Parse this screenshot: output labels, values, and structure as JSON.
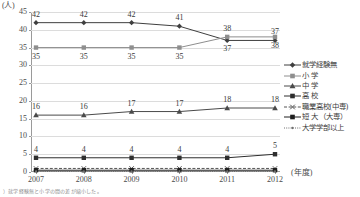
{
  "chart_data": {
    "type": "line",
    "title": "",
    "xlabel": "(年度)",
    "ylabel": "(人)",
    "categories": [
      "2007",
      "2008",
      "2009",
      "2010",
      "2011",
      "2012"
    ],
    "ylim": [
      0,
      45
    ],
    "ytick_step": 5,
    "yticks": [
      "0",
      "5",
      "10",
      "15",
      "20",
      "25",
      "30",
      "35",
      "40",
      "45"
    ],
    "grid": true,
    "legend_position": "right",
    "series": [
      {
        "name": "就学経験無",
        "marker": "diamond",
        "line": "solid",
        "color": "#3f3f3f",
        "values": [
          42,
          42,
          42,
          41,
          37,
          37
        ],
        "labels": [
          "42",
          "42",
          "42",
          "41",
          "37",
          "37"
        ],
        "label_side": [
          "above",
          "above",
          "above",
          "above",
          "below",
          "above"
        ]
      },
      {
        "name": "小 学",
        "marker": "square",
        "line": "solid",
        "color": "#8e8e8e",
        "values": [
          35,
          35,
          35,
          35,
          38,
          38
        ],
        "labels": [
          "35",
          "35",
          "35",
          "35",
          "38",
          "38"
        ],
        "label_side": [
          "below",
          "below",
          "below",
          "below",
          "above",
          "below"
        ]
      },
      {
        "name": "中 学",
        "marker": "triangle",
        "line": "solid",
        "color": "#4a4a4a",
        "values": [
          16,
          16,
          17,
          17,
          18,
          18
        ],
        "labels": [
          "16",
          "16",
          "17",
          "17",
          "18",
          "18"
        ],
        "label_side": [
          "above",
          "above",
          "above",
          "above",
          "above",
          "above"
        ]
      },
      {
        "name": "高 校",
        "marker": "square",
        "line": "solid",
        "color": "#2e2e2e",
        "values": [
          4,
          4,
          4,
          4,
          4,
          5
        ],
        "labels": [
          "4",
          "4",
          "4",
          "4",
          "4",
          "5"
        ],
        "label_side": [
          "above",
          "above",
          "above",
          "above",
          "above",
          "above"
        ]
      },
      {
        "name": "職業高校(中専)",
        "marker": "cross",
        "line": "dashed",
        "color": "#545454",
        "values": [
          1,
          1,
          1,
          1,
          1,
          1
        ],
        "labels": [
          "",
          "",
          "",
          "",
          "",
          ""
        ],
        "label_side": [
          "above",
          "above",
          "above",
          "above",
          "above",
          "above"
        ]
      },
      {
        "name": "短 大 （大専）",
        "marker": "square",
        "line": "solid",
        "color": "#1f1f1f",
        "values": [
          0.5,
          0.5,
          0.5,
          0.5,
          0.5,
          0.5
        ],
        "labels": [
          "",
          "",
          "",
          "",
          "",
          ""
        ],
        "label_side": [
          "above",
          "above",
          "above",
          "above",
          "above",
          "above"
        ]
      },
      {
        "name": "大学学部以上",
        "marker": "dot",
        "line": "dotted",
        "color": "#707070",
        "values": [
          0.2,
          0.2,
          0.2,
          0.2,
          0.2,
          0.2
        ],
        "labels": [
          "",
          "",
          "",
          "",
          "",
          ""
        ],
        "label_side": [
          "above",
          "above",
          "above",
          "above",
          "above",
          "above"
        ]
      }
    ]
  },
  "footnote": "）就学経験無と小学の間の差が縮小した。"
}
